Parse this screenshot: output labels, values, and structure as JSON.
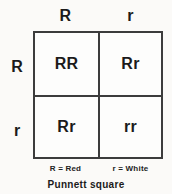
{
  "diagram": {
    "title": "Punnett square",
    "type": "punnett-square",
    "colors": {
      "background": "#fbfaf8",
      "grid_line": "#3c3c3c",
      "cell_fill": "#fdfdfc",
      "text": "#1b1b1b"
    },
    "column_headers": [
      "R",
      "r"
    ],
    "row_headers": [
      "R",
      "r"
    ],
    "cells": [
      [
        "RR",
        "Rr"
      ],
      [
        "Rr",
        "rr"
      ]
    ],
    "legend": [
      "R = Red",
      "r = White"
    ],
    "caption": "Punnett square"
  },
  "chart_data": {
    "type": "table",
    "title": "Punnett square",
    "columns": [
      "R",
      "r"
    ],
    "rows": [
      "R",
      "r"
    ],
    "values": [
      [
        "RR",
        "Rr"
      ],
      [
        "Rr",
        "rr"
      ]
    ],
    "legend_entries": [
      "R = Red",
      "r = White"
    ],
    "xlabel": "",
    "ylabel": ""
  }
}
